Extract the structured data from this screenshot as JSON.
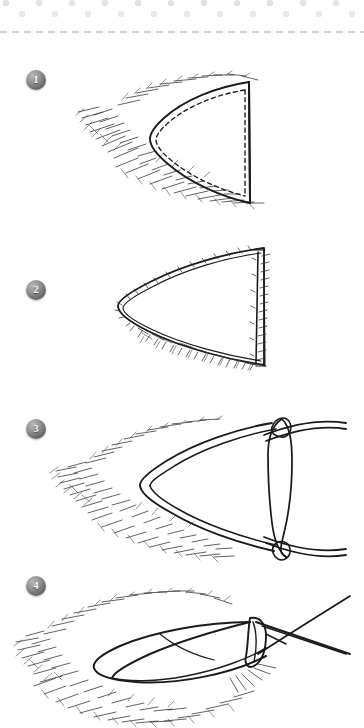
{
  "page": {
    "type": "hand-drawn sewing instruction sheet",
    "background_color": "#ffffff",
    "ink_color": "#1b1b1b"
  },
  "header": {
    "name": "dotted-decorative-band",
    "dot_color": "#e5e5e7",
    "dot_color_alt": "#ececee",
    "rows": 3,
    "cut_line": {
      "style": "dashed",
      "color": "#a9a9ad",
      "label": ""
    }
  },
  "steps": [
    {
      "number": "1",
      "name": "stitch-the-point",
      "description": "Pointed fabric panel stitched along two edges with a dashed seam line, raw frayed seam allowance sketched outside the point."
    },
    {
      "number": "2",
      "name": "trim-the-seam-allowance",
      "description": "The same point with the seam allowance trimmed close to the stitching, frayed edge hatching along the trimmed sides."
    },
    {
      "number": "3",
      "name": "insert-turning-tool",
      "description": "Point shown open at the right edge with a turning tool / loop inserted vertically to push the corner out."
    },
    {
      "number": "4",
      "name": "turn-and-press-point",
      "description": "Finished point turned right side out and pressed flat, with a pin or needle crossing the tip."
    }
  ],
  "badges": {
    "shape": "circle",
    "style": "3d-grey-sphere",
    "text_color": "#ffffff"
  },
  "icons": {
    "cut_line_icon": "dashed-cut-line-icon",
    "badge_icon": "numbered-step-badge-icon"
  }
}
